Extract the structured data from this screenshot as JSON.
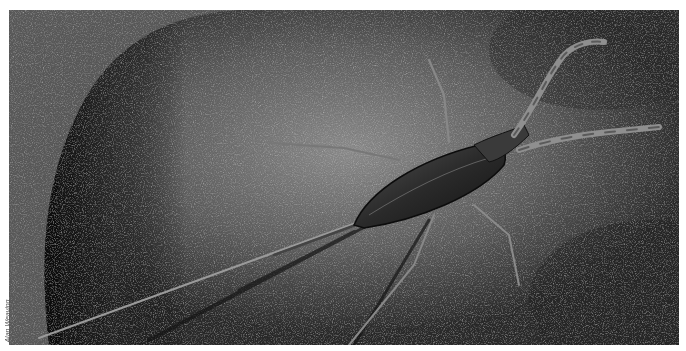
{
  "image": {
    "subject": "water scorpion insect on a rock",
    "style": "black-and-white photograph"
  },
  "credit": {
    "text": "Alan Weaving"
  },
  "colors": {
    "background": "#3a3a3a",
    "rock_light": "#8a8a8a",
    "rock_dark": "#1a1a1a"
  }
}
